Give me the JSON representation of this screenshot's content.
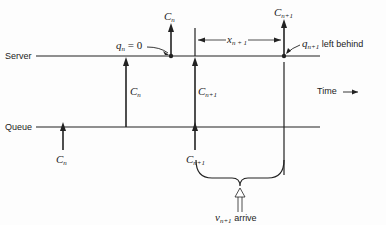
{
  "lines": {
    "server": "Server",
    "queue": "Queue"
  },
  "time_label": "Time",
  "labels": {
    "cn_queue": {
      "base": "C",
      "sub": "n"
    },
    "cn_server_up": {
      "base": "C",
      "sub": "n"
    },
    "cn_top": {
      "base": "C",
      "sub": "n"
    },
    "cn1_server": {
      "base": "C",
      "sub": "n+1"
    },
    "cn1_queue": {
      "base": "C",
      "sub": "n+1"
    },
    "cn1_top": {
      "base": "C",
      "sub": "n+1"
    },
    "qn": {
      "base": "q",
      "sub": "n",
      "rest": " = 0"
    },
    "qn1": {
      "base": "q",
      "sub": "n+1",
      "rest": " left behind"
    },
    "xn1": {
      "base": "x",
      "sub": "n + 1"
    },
    "vn1": {
      "base": "v",
      "sub": "n+1",
      "rest": " arrive"
    }
  }
}
